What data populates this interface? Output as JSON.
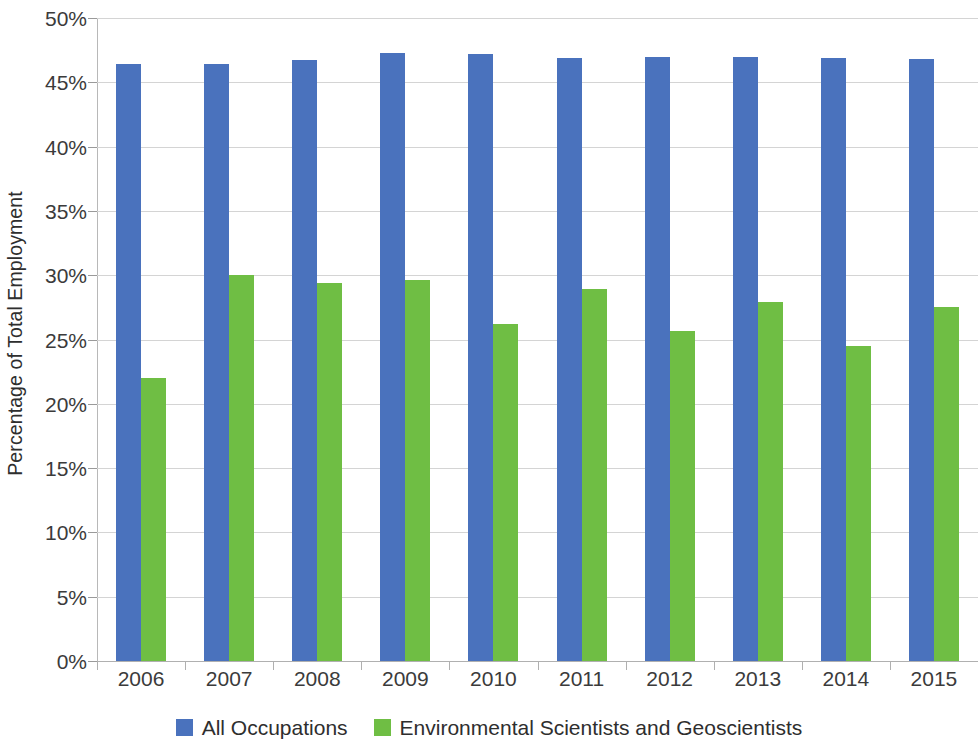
{
  "chart_data": {
    "type": "bar",
    "title": "",
    "subtitle": "",
    "xlabel": "",
    "ylabel": "Percentage of Total Employment",
    "categories": [
      "2006",
      "2007",
      "2008",
      "2009",
      "2010",
      "2011",
      "2012",
      "2013",
      "2014",
      "2015"
    ],
    "series": [
      {
        "name": "All Occupations",
        "color": "#4a72bd",
        "values": [
          46.4,
          46.4,
          46.7,
          47.3,
          47.2,
          46.9,
          47.0,
          47.0,
          46.9,
          46.8
        ]
      },
      {
        "name": "Environmental Scientists and Geoscientists",
        "color": "#6fbe44",
        "values": [
          22.0,
          30.0,
          29.4,
          29.6,
          26.2,
          28.9,
          25.7,
          27.9,
          24.5,
          27.5
        ]
      }
    ],
    "ylim": [
      0,
      50
    ],
    "ytick_values": [
      0,
      5,
      10,
      15,
      20,
      25,
      30,
      35,
      40,
      45,
      50
    ],
    "ytick_labels": [
      "0%",
      "5%",
      "10%",
      "15%",
      "20%",
      "25%",
      "30%",
      "35%",
      "40%",
      "45%",
      "50%"
    ],
    "grid": true,
    "grid_axis": "y",
    "legend_position": "bottom",
    "value_suffix": "%"
  },
  "legend": {
    "items": [
      {
        "label": "All Occupations",
        "color": "#4a72bd"
      },
      {
        "label": "Environmental Scientists and Geoscientists",
        "color": "#6fbe44"
      }
    ]
  }
}
